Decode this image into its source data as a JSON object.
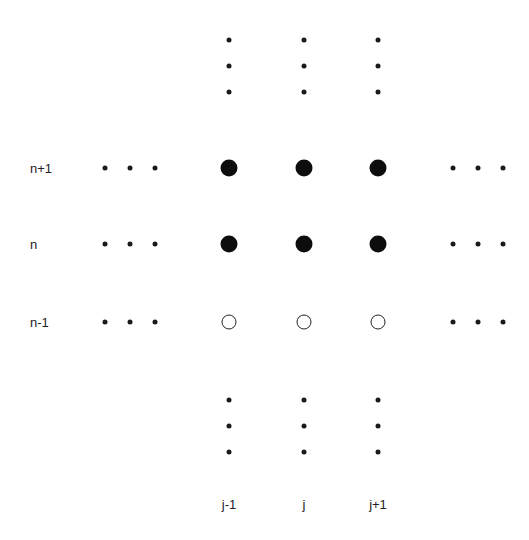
{
  "diagram": {
    "type": "finite-difference-stencil-grid",
    "row_labels": [
      {
        "text": "n+1",
        "x": 30,
        "y": 168
      },
      {
        "text": "n",
        "x": 30,
        "y": 244
      },
      {
        "text": "n-1",
        "x": 30,
        "y": 322
      }
    ],
    "column_labels": [
      {
        "text": "j-1",
        "x": 229,
        "y": 504
      },
      {
        "text": "j",
        "x": 304,
        "y": 504
      },
      {
        "text": "j+1",
        "x": 378,
        "y": 504
      }
    ],
    "nodes": [
      {
        "row": "n+1",
        "col": "j-1",
        "x": 229,
        "y": 168,
        "style": "filled"
      },
      {
        "row": "n+1",
        "col": "j",
        "x": 304,
        "y": 168,
        "style": "filled"
      },
      {
        "row": "n+1",
        "col": "j+1",
        "x": 378,
        "y": 168,
        "style": "filled"
      },
      {
        "row": "n",
        "col": "j-1",
        "x": 229,
        "y": 244,
        "style": "filled"
      },
      {
        "row": "n",
        "col": "j",
        "x": 304,
        "y": 244,
        "style": "filled"
      },
      {
        "row": "n",
        "col": "j+1",
        "x": 378,
        "y": 244,
        "style": "filled"
      },
      {
        "row": "n-1",
        "col": "j-1",
        "x": 229,
        "y": 322,
        "style": "open"
      },
      {
        "row": "n-1",
        "col": "j",
        "x": 304,
        "y": 322,
        "style": "open"
      },
      {
        "row": "n-1",
        "col": "j+1",
        "x": 378,
        "y": 322,
        "style": "open"
      }
    ],
    "ellipsis_dots": {
      "top_columns_x": [
        229,
        304,
        378
      ],
      "top_y": [
        40,
        66,
        92
      ],
      "bottom_columns_x": [
        229,
        304,
        378
      ],
      "bottom_y": [
        400,
        426,
        452
      ],
      "left_x": [
        105,
        130,
        155
      ],
      "right_x": [
        453,
        478,
        503
      ],
      "side_rows_y": [
        168,
        244,
        322
      ]
    }
  }
}
